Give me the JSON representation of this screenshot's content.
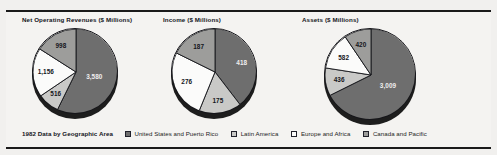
{
  "figure": {
    "legend_title": "1982 Data by Geographic Area"
  },
  "colors": {
    "us_puerto_rico": "#6e6e6e",
    "latin_america": "#c9c9c7",
    "europe_africa": "#fbfbfa",
    "canada_pacific": "#9d9d9b",
    "outline": "#15161b",
    "background": "#f4f3f1"
  },
  "legend": {
    "items": [
      {
        "label": "United States and Puerto Rico",
        "color": "#6e6e6e"
      },
      {
        "label": "Latin America",
        "color": "#c9c9c7"
      },
      {
        "label": "Europe and Africa",
        "color": "#fbfbfa"
      },
      {
        "label": "Canada and Pacific",
        "color": "#9d9d9b"
      }
    ]
  },
  "chart_data": [
    {
      "type": "pie",
      "title": "Net Operating Revenues ($ Millions)",
      "categories": [
        "United States and Puerto Rico",
        "Latin America",
        "Europe and Africa",
        "Canada and Pacific"
      ],
      "values": [
        3580,
        516,
        1156,
        998
      ],
      "labels": [
        "3,580",
        "516",
        "1,156",
        "998"
      ],
      "colors": [
        "#6e6e6e",
        "#c9c9c7",
        "#fbfbfa",
        "#9d9d9b"
      ],
      "label_colors": [
        "light",
        "dark",
        "dark",
        "dark"
      ],
      "legend_position": "bottom"
    },
    {
      "type": "pie",
      "title": "Income ($ Millions)",
      "categories": [
        "United States and Puerto Rico",
        "Latin America",
        "Europe and Africa",
        "Canada and Pacific"
      ],
      "values": [
        418,
        175,
        276,
        187
      ],
      "labels": [
        "418",
        "175",
        "276",
        "187"
      ],
      "colors": [
        "#6e6e6e",
        "#c9c9c7",
        "#fbfbfa",
        "#9d9d9b"
      ],
      "label_colors": [
        "light",
        "dark",
        "dark",
        "dark"
      ],
      "legend_position": "bottom"
    },
    {
      "type": "pie",
      "title": "Assets ($ Millions)",
      "categories": [
        "United States and Puerto Rico",
        "Latin America",
        "Europe and Africa",
        "Canada and Pacific"
      ],
      "values": [
        3009,
        436,
        582,
        420
      ],
      "labels": [
        "3,009",
        "436",
        "582",
        "420"
      ],
      "colors": [
        "#6e6e6e",
        "#c9c9c7",
        "#fbfbfa",
        "#9d9d9b"
      ],
      "label_colors": [
        "light",
        "dark",
        "dark",
        "dark"
      ],
      "legend_position": "bottom"
    }
  ],
  "charts_layout": [
    {
      "left": 22,
      "top": 16,
      "pie_left": 10,
      "pie_top": 12,
      "size": 86,
      "start_angle": 0
    },
    {
      "left": 163,
      "top": 16,
      "pie_left": 8,
      "pie_top": 12,
      "size": 86,
      "start_angle": 0
    },
    {
      "left": 302,
      "top": 16,
      "pie_left": 22,
      "pie_top": 12,
      "size": 92,
      "start_angle": 0
    }
  ]
}
